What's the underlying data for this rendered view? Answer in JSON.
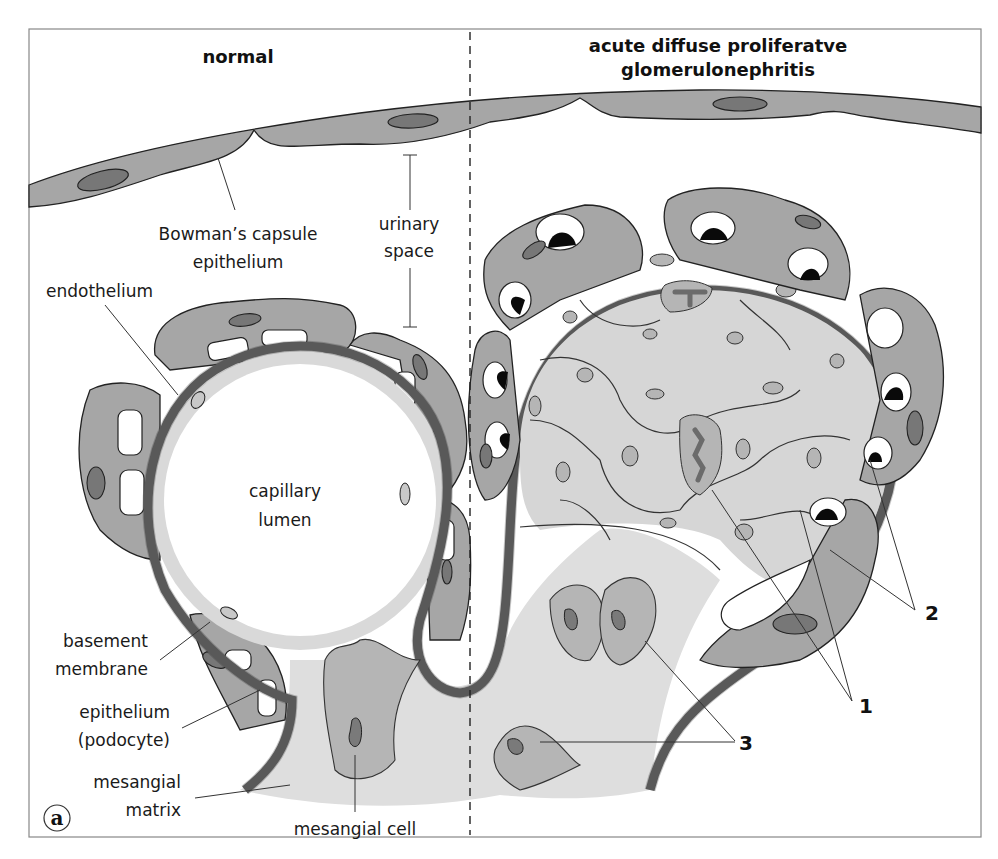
{
  "figure": {
    "panel_letter": "a",
    "titles": {
      "left": "normal",
      "right_line1": "acute diffuse proliferatve",
      "right_line2": "glomerulonephritis"
    },
    "labels": {
      "bowman_line1": "Bowman’s capsule",
      "bowman_line2": "epithelium",
      "urinary_line1": "urinary",
      "urinary_line2": "space",
      "endothelium": "endothelium",
      "capillary_line1": "capillary",
      "capillary_line2": "lumen",
      "basement_line1": "basement",
      "basement_line2": "membrane",
      "epithelium_line1": "epithelium",
      "epithelium_line2": "(podocyte)",
      "matrix_line1": "mesangial",
      "matrix_line2": "matrix",
      "mesangial_cell": "mesangial cell"
    },
    "callouts": {
      "one": "1",
      "two": "2",
      "three": "3"
    },
    "colors": {
      "border": "#808080",
      "capsule_fill": "#a6a6a6",
      "cell_dark": "#7a7a7a",
      "nucleus": "#777777",
      "basement_membrane": "#6b6b6b",
      "endothelium_fill": "#d9d9d9",
      "matrix_fill": "#dedede",
      "mesangial_cell_fill": "#b5b5b5",
      "proliferation_fill": "#d6d6d6",
      "deposit_black": "#0a0a0a",
      "outline": "#222222"
    }
  }
}
